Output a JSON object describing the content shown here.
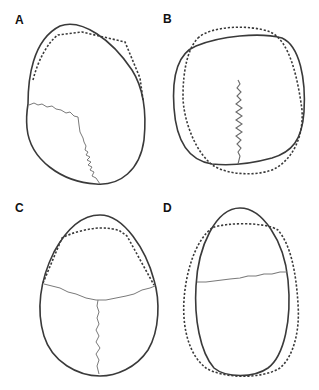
{
  "figure": {
    "panels": [
      {
        "id": "A",
        "label": "A",
        "description": "Skull outline, asymmetric oblique shape with one lateral suture and sagittal suture"
      },
      {
        "id": "B",
        "label": "B",
        "description": "Round skull outline with sagittal suture"
      },
      {
        "id": "C",
        "label": "C",
        "description": "Egg-shaped skull outline with coronal and sagittal sutures"
      },
      {
        "id": "D",
        "label": "D",
        "description": "Narrow elongated skull outline with coronal suture"
      }
    ],
    "legend": {
      "solid_line": "actual outline",
      "dashed_line": "reference outline"
    },
    "colors": {
      "outline": "#3a3a3a",
      "suture": "#7a7a7a",
      "background": "#ffffff"
    }
  }
}
